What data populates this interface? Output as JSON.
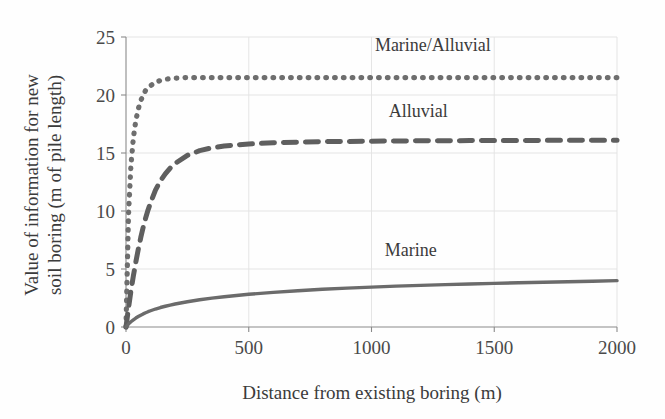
{
  "chart_data": {
    "type": "line",
    "title": "",
    "xlabel": "Distance from existing boring (m)",
    "ylabel": "Value of information for new soil boring (m of pile length)",
    "ylabel_line1": "Value of information for new",
    "ylabel_line2": "soil boring (m of pile length)",
    "xlim": [
      0,
      2000
    ],
    "ylim": [
      0,
      25
    ],
    "xticks": [
      0,
      500,
      1000,
      1500,
      2000
    ],
    "xtick_labels": [
      "0",
      "500",
      "1000",
      "1500",
      "2000"
    ],
    "yticks": [
      0,
      5,
      10,
      15,
      20,
      25
    ],
    "ytick_labels": [
      "0",
      "5",
      "10",
      "15",
      "20",
      "25"
    ],
    "grid": true,
    "legend_position": "inline-annotations",
    "x": [
      0,
      10,
      20,
      30,
      40,
      50,
      60,
      70,
      80,
      90,
      100,
      120,
      140,
      160,
      180,
      200,
      250,
      300,
      350,
      400,
      450,
      500,
      600,
      700,
      800,
      900,
      1000,
      1100,
      1200,
      1300,
      1400,
      1500,
      1600,
      1700,
      1800,
      1900,
      2000
    ],
    "series": [
      {
        "name": "Marine/Alluvial",
        "style": "dotted",
        "color": "#6e6e6e",
        "label_x": 1250,
        "label_y": 23.8,
        "plateau": 21.5,
        "values": [
          0,
          9.6,
          13.9,
          16.3,
          17.8,
          18.8,
          19.5,
          20.0,
          20.4,
          20.6,
          20.8,
          21.1,
          21.25,
          21.35,
          21.42,
          21.45,
          21.5,
          21.5,
          21.5,
          21.5,
          21.5,
          21.5,
          21.5,
          21.5,
          21.5,
          21.5,
          21.5,
          21.5,
          21.5,
          21.5,
          21.5,
          21.5,
          21.5,
          21.5,
          21.5,
          21.5,
          21.5
        ]
      },
      {
        "name": "Alluvial",
        "style": "dashed",
        "color": "#5f5f5f",
        "label_x": 1190,
        "label_y": 18.1,
        "plateau": 16.1,
        "values": [
          0,
          1.6,
          3.1,
          4.4,
          5.6,
          6.7,
          7.7,
          8.6,
          9.4,
          10.1,
          10.7,
          11.8,
          12.6,
          13.2,
          13.7,
          14.1,
          14.8,
          15.2,
          15.45,
          15.6,
          15.7,
          15.78,
          15.88,
          15.94,
          15.98,
          16.0,
          16.02,
          16.04,
          16.05,
          16.06,
          16.07,
          16.08,
          16.08,
          16.09,
          16.09,
          16.1,
          16.1
        ]
      },
      {
        "name": "Marine",
        "style": "solid",
        "color": "#6b6b6b",
        "label_x": 1160,
        "label_y": 6.1,
        "plateau": 4.0,
        "values": [
          0,
          0.25,
          0.45,
          0.62,
          0.77,
          0.9,
          1.02,
          1.13,
          1.23,
          1.32,
          1.4,
          1.55,
          1.68,
          1.79,
          1.89,
          1.98,
          2.18,
          2.35,
          2.49,
          2.61,
          2.72,
          2.82,
          2.99,
          3.13,
          3.25,
          3.35,
          3.44,
          3.52,
          3.59,
          3.65,
          3.71,
          3.76,
          3.81,
          3.86,
          3.9,
          3.95,
          4.0
        ]
      }
    ]
  },
  "axes": {
    "x_axis_name": "distance-axis",
    "y_axis_name": "value-axis"
  }
}
